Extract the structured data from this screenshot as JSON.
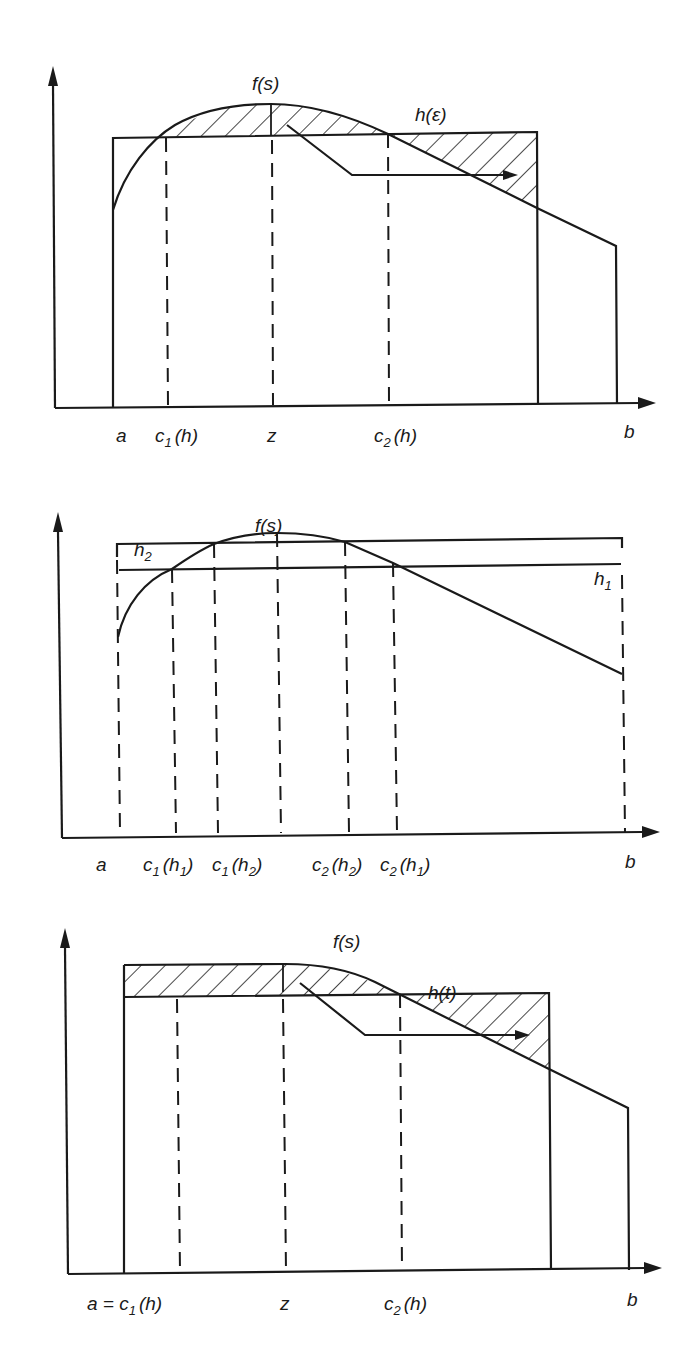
{
  "figure": {
    "panels": [
      {
        "id": "panel-1",
        "curve_label": "f(s)",
        "level_label": "h(ε)",
        "axis_labels": [
          {
            "key": "a",
            "text": "a"
          },
          {
            "key": "c1",
            "base": "c",
            "sub": "1",
            "arg": "(h)"
          },
          {
            "key": "z",
            "text": "z"
          },
          {
            "key": "c2",
            "base": "c",
            "sub": "2",
            "arg": "(h)"
          },
          {
            "key": "b",
            "text": "b"
          }
        ]
      },
      {
        "id": "panel-2",
        "curve_label": "f(s)",
        "level_labels": [
          {
            "base": "h",
            "sub": "2"
          },
          {
            "base": "h",
            "sub": "1"
          }
        ],
        "axis_labels": [
          {
            "key": "a",
            "text": "a"
          },
          {
            "key": "c1h1",
            "base": "c",
            "sub": "1",
            "arg_base": "(h",
            "arg_sub": "1",
            "arg_close": ")"
          },
          {
            "key": "c1h2",
            "base": "c",
            "sub": "1",
            "arg_base": "(h",
            "arg_sub": "2",
            "arg_close": ")"
          },
          {
            "key": "c2h2",
            "base": "c",
            "sub": "2",
            "arg_base": "(h",
            "arg_sub": "2",
            "arg_close": ")"
          },
          {
            "key": "c2h1",
            "base": "c",
            "sub": "2",
            "arg_base": "(h",
            "arg_sub": "1",
            "arg_close": ")"
          },
          {
            "key": "b",
            "text": "b"
          }
        ]
      },
      {
        "id": "panel-3",
        "curve_label": "f(s)",
        "level_label": "h(t)",
        "axis_labels": [
          {
            "key": "a_c1",
            "prefix": "a = ",
            "base": "c",
            "sub": "1",
            "arg": "(h)"
          },
          {
            "key": "z",
            "text": "z"
          },
          {
            "key": "c2",
            "base": "c",
            "sub": "2",
            "arg": "(h)"
          },
          {
            "key": "b",
            "text": "b"
          }
        ]
      }
    ]
  }
}
